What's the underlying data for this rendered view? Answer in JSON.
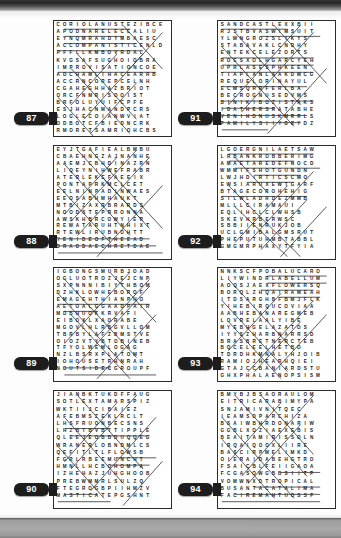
{
  "page": {
    "kind": "word-search-puzzle-book-page",
    "top_band_color": "#242424",
    "bottom_band_color": "#a9a9a9",
    "grid_border_color": "#2b2b2b",
    "badge_color": "#1d1d1d",
    "badge_text_color": "#ffffff",
    "letter_color": "#171717",
    "solution_line_color": "#2e2e2e",
    "columns": 2,
    "rows": 4,
    "puzzle_count": 8
  },
  "puzzles": [
    {
      "number": "87",
      "cols": 18,
      "rows": 16,
      "left": 53,
      "top": 20,
      "width": 119,
      "height": 117,
      "badge_left": 14,
      "badge_top": 112,
      "rows_text": [
        "CORIOLANUSTEZIBCE",
        "APODNARELECCALIU",
        "EYNQMRAHDYMBAESC",
        "ACCOMPANISTICENLD",
        "PFFLLKMBOVRDAL",
        "KVGSAFSUGHOIOBRA",
        "IMPROVISATIONCOE",
        "ADCHAMLIHACEARRB",
        "ACCRNCOREPCELNH",
        "CGAHEGHHAZBRIOT",
        "ORCFNMRISOOIST",
        "BRFOLUYUIFCPFE",
        "ESJHACNMANDPCRS",
        "LOGLECOIANWVIAT",
        "ODBOTCFBIEDNCRK",
        "RMORETSAMRIOHCBS"
      ],
      "solutions": [
        {
          "x1": 1,
          "y1": 0.5,
          "x2": 11,
          "y2": 0.5
        },
        {
          "x1": 1,
          "y1": 1.5,
          "x2": 10,
          "y2": 1.5
        },
        {
          "x1": 1,
          "y1": 2.5,
          "x2": 12,
          "y2": 2.5
        },
        {
          "x1": 0,
          "y1": 3.5,
          "x2": 13,
          "y2": 3.5
        },
        {
          "x1": 0,
          "y1": 6.5,
          "x2": 15,
          "y2": 6.5
        },
        {
          "x1": 1,
          "y1": 15.5,
          "x2": 15,
          "y2": 15.5
        },
        {
          "x1": 10,
          "y1": 0,
          "x2": 16,
          "y2": 6
        },
        {
          "x1": 3,
          "y1": 4,
          "x2": 12,
          "y2": 13
        },
        {
          "x1": 2,
          "y1": 6,
          "x2": 11,
          "y2": 15
        },
        {
          "x1": 0,
          "y1": 10,
          "x2": 6,
          "y2": 16
        },
        {
          "x1": 13,
          "y1": 4,
          "x2": 4,
          "y2": 13
        },
        {
          "x1": 12,
          "y1": 8,
          "x2": 5,
          "y2": 15
        },
        {
          "x1": 9,
          "y1": 4,
          "x2": 2,
          "y2": 11
        },
        {
          "x1": 16,
          "y1": 1,
          "x2": 11,
          "y2": 6
        }
      ]
    },
    {
      "number": "88",
      "cols": 18,
      "rows": 16,
      "left": 53,
      "top": 145,
      "width": 119,
      "height": 115,
      "badge_left": 14,
      "badge_top": 235,
      "rows_text": [
        "EYJTGAFIEALBMBU",
        "CBAEHNGZAJNANHE",
        "AAEMJCBHDINAZRN",
        "LIQEYNIHWEFRABR",
        "ATERLEKEFAEEIX",
        "PONTAPRKMCLCET",
        "EELNINPADINWAES",
        "EEOSABHMHAUKT",
        "MTBIZAXRBRARDS",
        "NOODSTEPRRONNA",
        "AWSKHBRCOWYIEP",
        "REWATARUHTNHIXT",
        "RTEWLIRUBNOHTT",
        "YENIDEOFTHEEAD",
        "DRAODAECHRETDAE"
      ],
      "solutions": [
        {
          "x1": 0,
          "y1": 12.5,
          "x2": 14,
          "y2": 12.5
        },
        {
          "x1": 0,
          "y1": 13.5,
          "x2": 15,
          "y2": 13.5
        },
        {
          "x1": 0,
          "y1": 14.5,
          "x2": 16,
          "y2": 14.5
        },
        {
          "x1": 3,
          "y1": 0,
          "x2": 13,
          "y2": 10
        },
        {
          "x1": 1,
          "y1": 2,
          "x2": 11,
          "y2": 12
        },
        {
          "x1": 0,
          "y1": 5,
          "x2": 8,
          "y2": 13
        },
        {
          "x1": 5,
          "y1": 0,
          "x2": 16,
          "y2": 11
        },
        {
          "x1": 14,
          "y1": 1,
          "x2": 3,
          "y2": 12
        },
        {
          "x1": 12,
          "y1": 0,
          "x2": 2,
          "y2": 10
        },
        {
          "x1": 16,
          "y1": 5,
          "x2": 6,
          "y2": 15
        },
        {
          "x1": 9,
          "y1": 1,
          "x2": 1,
          "y2": 9
        },
        {
          "x1": 7,
          "y1": 4,
          "x2": 14,
          "y2": 11
        }
      ]
    },
    {
      "number": "89",
      "cols": 18,
      "rows": 16,
      "left": 53,
      "top": 267,
      "width": 119,
      "height": 115,
      "badge_left": 14,
      "badge_top": 357,
      "rows_text": [
        "IGBONGSMURBJOAD",
        "OGLUOTROZJEJCNP",
        "SXPNNNIBIYTHBOM",
        "DZHKLOWHEBOROF",
        "EMAGEHTHIANPHO",
        "AETOALGGAADPAIR",
        "MDBHUOKKRVAFI",
        "EIBOXLXAORABE",
        "MGOVLHLRBGVLLOM",
        "TBRBYLAFZBMSTVE",
        "OIOZVTYBTOBINEB",
        "TFYOLWEMLOGAG",
        "NZLBSRXPLATOMT",
        "IOHOUSETRHNRAH",
        "NOUTSIDECGROUPF"
      ],
      "solutions": [
        {
          "x1": 1,
          "y1": 5.5,
          "x2": 6,
          "y2": 5.5
        },
        {
          "x1": 1,
          "y1": 13.5,
          "x2": 8,
          "y2": 13.5
        },
        {
          "x1": 1,
          "y1": 14.5,
          "x2": 15,
          "y2": 14.5
        },
        {
          "x1": 0,
          "y1": 4.5,
          "x2": 14,
          "y2": 4.5
        },
        {
          "x1": 1,
          "y1": 1,
          "x2": 12,
          "y2": 12
        },
        {
          "x1": 0,
          "y1": 3,
          "x2": 10,
          "y2": 13
        },
        {
          "x1": 2,
          "y1": 6,
          "x2": 11,
          "y2": 15
        },
        {
          "x1": 14,
          "y1": 2,
          "x2": 3,
          "y2": 13
        },
        {
          "x1": 15,
          "y1": 6,
          "x2": 6,
          "y2": 15
        },
        {
          "x1": 11,
          "y1": 0,
          "x2": 1,
          "y2": 10
        },
        {
          "x1": 8,
          "y1": 0,
          "x2": 15,
          "y2": 7
        },
        {
          "x1": 6,
          "y1": 9,
          "x2": 14,
          "y2": 1
        }
      ]
    },
    {
      "number": "90",
      "cols": 18,
      "rows": 16,
      "left": 53,
      "top": 390,
      "width": 119,
      "height": 119,
      "badge_left": 14,
      "badge_top": 483,
      "rows_text": [
        "JIANBKTUKDFFAUG",
        "SOTLEXTAMARSPIZ",
        "WKTIIJCIBAIEZ",
        "AFEBMSZEKLRCLT",
        "LHSFRUONBECSNS",
        "LHZBTBVBITIPPLE",
        "QLEEJEOBBDUQQEG",
        "WRANERLOBNDMLCS",
        "QEFITLTLFLOWSB",
        "FGRLRBEEMUNCHT",
        "HMNLLHCBOHOMPA",
        "IZHEHAZJUHGHOOB",
        "PREBWMMRLSULZQ",
        "FTEGROGBPIIHMZV",
        "MASTICATEPGSHNT"
      ],
      "solutions": [
        {
          "x1": 1,
          "y1": 4.5,
          "x2": 8,
          "y2": 4.5
        },
        {
          "x1": 2,
          "y1": 5.5,
          "x2": 14,
          "y2": 5.5
        },
        {
          "x1": 9,
          "y1": 8.5,
          "x2": 15,
          "y2": 8.5
        },
        {
          "x1": 8,
          "y1": 9.5,
          "x2": 14,
          "y2": 9.5
        },
        {
          "x1": 0,
          "y1": 14.5,
          "x2": 8,
          "y2": 14.5
        },
        {
          "x1": 1,
          "y1": 13.5,
          "x2": 6,
          "y2": 13.5
        },
        {
          "x1": 3,
          "y1": 0,
          "x2": 13,
          "y2": 10
        },
        {
          "x1": 1,
          "y1": 3,
          "x2": 10,
          "y2": 12
        },
        {
          "x1": 0,
          "y1": 7,
          "x2": 7,
          "y2": 14
        },
        {
          "x1": 12,
          "y1": 0,
          "x2": 2,
          "y2": 10
        },
        {
          "x1": 15,
          "y1": 3,
          "x2": 5,
          "y2": 13
        },
        {
          "x1": 9,
          "y1": 1,
          "x2": 1,
          "y2": 9
        },
        {
          "x1": 16,
          "y1": 9,
          "x2": 10,
          "y2": 15
        }
      ]
    },
    {
      "number": "91",
      "cols": 18,
      "rows": 16,
      "left": 217,
      "top": 20,
      "width": 119,
      "height": 117,
      "badge_left": 178,
      "badge_top": 112,
      "rows_text": [
        "SANDCASTLEXXBII",
        "RJSTBVASWIMSUIT",
        "YLWNGROZSLIKYS",
        "STABAVAKLCNDHY",
        "ENTEKCELEZORTS",
        "ROESXOLHGARCYEH",
        "UPRLASESPHKEEN",
        "TIAPLANLAAKDMCG",
        "REQUELORINAYUL",
        "ECWSQRRFERLBA",
        "BECROGNUSEDVMS",
        "BINIKIBOZISTAKS",
        "IDATHERSRATABHE",
        "VENIHONUSKMRRLS",
        "FAMILYSIIYGEYDZ"
      ],
      "solutions": [
        {
          "x1": 0,
          "y1": 0.5,
          "x2": 10,
          "y2": 0.5
        },
        {
          "x1": 6,
          "y1": 1.5,
          "x2": 15,
          "y2": 1.5
        },
        {
          "x1": 0,
          "y1": 4.5,
          "x2": 14,
          "y2": 4.5
        },
        {
          "x1": 0,
          "y1": 5.5,
          "x2": 14,
          "y2": 5.5
        },
        {
          "x1": 0,
          "y1": 6.5,
          "x2": 14,
          "y2": 6.5
        },
        {
          "x1": 0,
          "y1": 8.5,
          "x2": 13,
          "y2": 8.5
        },
        {
          "x1": 0,
          "y1": 10.5,
          "x2": 14,
          "y2": 10.5
        },
        {
          "x1": 0,
          "y1": 11.5,
          "x2": 8,
          "y2": 11.5
        },
        {
          "x1": 0,
          "y1": 12.5,
          "x2": 13,
          "y2": 12.5
        },
        {
          "x1": 0,
          "y1": 13.5,
          "x2": 12,
          "y2": 13.5
        },
        {
          "x1": 0,
          "y1": 14.5,
          "x2": 7,
          "y2": 14.5
        },
        {
          "x1": 2,
          "y1": 1,
          "x2": 12,
          "y2": 11
        },
        {
          "x1": 0,
          "y1": 3,
          "x2": 11,
          "y2": 14
        },
        {
          "x1": 14,
          "y1": 1,
          "x2": 3,
          "y2": 12
        },
        {
          "x1": 12,
          "y1": 0,
          "x2": 1,
          "y2": 11
        },
        {
          "x1": 16,
          "y1": 6,
          "x2": 7,
          "y2": 15
        },
        {
          "x1": 8,
          "y1": 0,
          "x2": 16,
          "y2": 8
        }
      ]
    },
    {
      "number": "92",
      "cols": 18,
      "rows": 16,
      "left": 217,
      "top": 145,
      "width": 119,
      "height": 115,
      "badge_left": 178,
      "badge_top": 235,
      "rows_text": [
        "LGOERGNILAETSAW",
        "LRBANKROBBERIMG",
        "AMAETAREDEFNOCD",
        "WMMIFSHOTGUNDN",
        "LWJHDIRTICSCMO",
        "EWSIARUXEWTGARF",
        "BTAGECOROHEHIG",
        "SILWLADRDEZMMB",
        "MLLLCIRAMAUI",
        "EQLIHCLCLWHSB",
        "SKEVHRBERWSC",
        "SBBIIENRUKJOB",
        "UCLGMIBALGMSRUT",
        "PHEPUTUHMBTABBL",
        "GMGMRPHAXYTFYIA"
      ],
      "solutions": [
        {
          "x1": 1,
          "y1": 0.5,
          "x2": 14,
          "y2": 0.5
        },
        {
          "x1": 1,
          "y1": 1.5,
          "x2": 11,
          "y2": 1.5
        },
        {
          "x1": 2,
          "y1": 2.5,
          "x2": 15,
          "y2": 2.5
        },
        {
          "x1": 5,
          "y1": 3.5,
          "x2": 12,
          "y2": 3.5
        },
        {
          "x1": 4,
          "y1": 4.5,
          "x2": 11,
          "y2": 4.5
        },
        {
          "x1": 0,
          "y1": 6.5,
          "x2": 13,
          "y2": 6.5
        },
        {
          "x1": 2,
          "y1": 1,
          "x2": 7,
          "y2": 6
        },
        {
          "x1": 1,
          "y1": 5,
          "x2": 12,
          "y2": 15
        },
        {
          "x1": 2,
          "y1": 8,
          "x2": 10,
          "y2": 15
        },
        {
          "x1": 14,
          "y1": 3,
          "x2": 4,
          "y2": 13
        },
        {
          "x1": 13,
          "y1": 7,
          "x2": 6,
          "y2": 14
        },
        {
          "x1": 10,
          "y1": 5,
          "x2": 2,
          "y2": 13
        },
        {
          "x1": 16,
          "y1": 8,
          "x2": 9,
          "y2": 15
        }
      ]
    },
    {
      "number": "93",
      "cols": 18,
      "rows": 16,
      "left": 217,
      "top": 267,
      "width": 119,
      "height": 115,
      "badge_left": 178,
      "badge_top": 357,
      "rows_text": [
        "NNKSCFPOBALUCARO",
        "LIYWINDRLABELLUM",
        "AOQSJAEXFLOWERSQ",
        "BORQLZHQAIRAMEAH",
        "ITDSARGHBFBMJFLK",
        "YIHEBIRQUCOVIAA",
        "AABHEBANAREGMEB",
        "LOVRELAALYIBE",
        "MYEBHGELAZATOS",
        "IYYSZHARBNARRSD",
        "BRASBRETNERCTEB",
        "BQCELEELHETBO",
        "TDRDHKMNALYHJOIB",
        "RAMIOJHEARHQIEI",
        "GTAJCCBANIARDSTU",
        "GHXPHALAENOPSISM"
      ],
      "solutions": [
        {
          "x1": 7,
          "y1": 0.5,
          "x2": 16,
          "y2": 0.5
        },
        {
          "x1": 7,
          "y1": 1.5,
          "x2": 16,
          "y2": 1.5
        },
        {
          "x1": 6,
          "y1": 2.5,
          "x2": 14,
          "y2": 2.5
        },
        {
          "x1": 9,
          "y1": 3.5,
          "x2": 15,
          "y2": 3.5
        },
        {
          "x1": 2,
          "y1": 15.5,
          "x2": 16,
          "y2": 15.5
        },
        {
          "x1": 1,
          "y1": 1,
          "x2": 11,
          "y2": 11
        },
        {
          "x1": 0,
          "y1": 4,
          "x2": 10,
          "y2": 14
        },
        {
          "x1": 1,
          "y1": 7,
          "x2": 9,
          "y2": 15
        },
        {
          "x1": 14,
          "y1": 4,
          "x2": 4,
          "y2": 14
        },
        {
          "x1": 12,
          "y1": 7,
          "x2": 5,
          "y2": 14
        },
        {
          "x1": 9,
          "y1": 3,
          "x2": 1,
          "y2": 11
        },
        {
          "x1": 16,
          "y1": 6,
          "x2": 8,
          "y2": 14
        }
      ]
    },
    {
      "number": "94",
      "cols": 18,
      "rows": 16,
      "left": 217,
      "top": 390,
      "width": 119,
      "height": 119,
      "badge_left": 178,
      "badge_top": 483,
      "rows_text": [
        "BMYBJBSAORAULOM",
        "EITRICARABIMYPA",
        "SNJAMIVNITQEC",
        "IEAMSOPARCHIZA",
        "BSAIWBHRDONARIW",
        "GGBLXOZIAEXEBIS",
        "BEAITAMIRISSOLN",
        "IRQAIQOOXLIIRE",
        "BASCIRPMELIMKD",
        "OIERAIDABEHGTRO",
        "FSAICBLFEIIGAOA",
        "FCGASOWGBBSIITP",
        "VOMWNXDTROPICAL",
        "BUSANTACATALIMA",
        "FACIREMAHTUOSSF"
      ],
      "solutions": [
        {
          "x1": 5,
          "y1": 12.5,
          "x2": 15,
          "y2": 12.5
        },
        {
          "x1": 2,
          "y1": 13.5,
          "x2": 15,
          "y2": 13.5
        },
        {
          "x1": 0,
          "y1": 14.5,
          "x2": 15,
          "y2": 14.5
        },
        {
          "x1": 9,
          "y1": 10.5,
          "x2": 15,
          "y2": 10.5
        },
        {
          "x1": 2,
          "y1": 0,
          "x2": 13,
          "y2": 11
        },
        {
          "x1": 0,
          "y1": 3,
          "x2": 11,
          "y2": 14
        },
        {
          "x1": 0,
          "y1": 6,
          "x2": 8,
          "y2": 14
        },
        {
          "x1": 14,
          "y1": 0,
          "x2": 3,
          "y2": 11
        },
        {
          "x1": 12,
          "y1": 4,
          "x2": 4,
          "y2": 12
        },
        {
          "x1": 9,
          "y1": 1,
          "x2": 1,
          "y2": 9
        },
        {
          "x1": 6,
          "y1": 0,
          "x2": 14,
          "y2": 8
        }
      ]
    }
  ]
}
